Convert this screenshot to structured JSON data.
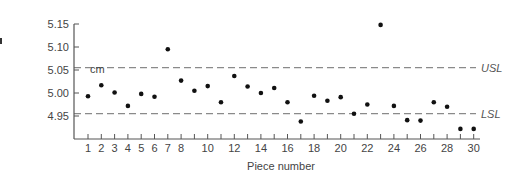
{
  "chart_data": {
    "type": "scatter",
    "title": "",
    "xlabel": "Piece number",
    "ylabel": "cm",
    "xlim": [
      1,
      30
    ],
    "ylim": [
      4.9,
      5.15
    ],
    "grid": false,
    "y_ticks": [
      "5.15",
      "5.10",
      "5.05",
      "5.00",
      "4.95"
    ],
    "y_tick_values": [
      5.15,
      5.1,
      5.05,
      5.0,
      4.95
    ],
    "x_tick_labels": [
      "1",
      "2",
      "3",
      "4",
      "5",
      "6",
      "7",
      "8",
      "10",
      "12",
      "14",
      "16",
      "18",
      "20",
      "22",
      "24",
      "26",
      "28",
      "30"
    ],
    "x_tick_values": [
      1,
      2,
      3,
      4,
      5,
      6,
      7,
      8,
      10,
      12,
      14,
      16,
      18,
      20,
      22,
      24,
      26,
      28,
      30
    ],
    "x_minor_ticks": [
      9,
      11,
      13,
      15,
      17,
      19,
      21,
      23,
      25,
      27,
      29
    ],
    "reference_lines": [
      {
        "name": "USL",
        "label": "USL",
        "value": 5.055,
        "style": "dashed"
      },
      {
        "name": "LSL",
        "label": "LSL",
        "value": 4.955,
        "style": "dashed"
      }
    ],
    "series": [
      {
        "name": "measurements",
        "x": [
          1,
          2,
          3,
          4,
          5,
          6,
          7,
          8,
          9,
          10,
          11,
          12,
          13,
          14,
          15,
          16,
          17,
          18,
          19,
          20,
          21,
          22,
          23,
          24,
          25,
          26,
          27,
          28,
          29,
          30
        ],
        "y": [
          4.993,
          5.017,
          5.001,
          4.972,
          4.998,
          4.992,
          5.095,
          5.027,
          5.005,
          5.015,
          4.98,
          5.037,
          5.014,
          5.0,
          5.011,
          4.98,
          4.938,
          4.994,
          4.983,
          4.991,
          4.955,
          4.975,
          5.148,
          4.972,
          4.941,
          4.94,
          4.98,
          4.97,
          4.922,
          4.922
        ]
      }
    ]
  },
  "colors": {
    "points": "#111111",
    "axis": "#555555",
    "limit_lines": "#8a8a8a",
    "text": "#444444"
  }
}
